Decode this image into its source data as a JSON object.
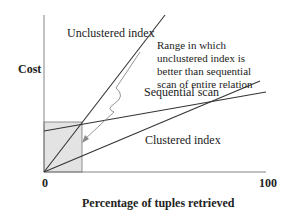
{
  "figure": {
    "y_axis_label": "Cost",
    "x_axis_label": "Percentage of tuples retrieved",
    "x_tick_min": "0",
    "x_tick_max": "100",
    "series_labels": {
      "unclustered": "Unclustered index",
      "sequential": "Sequential scan",
      "clustered": "Clustered index"
    },
    "annotation": "Range in which unclustered index is better than sequential scan of entire relation",
    "colors": {
      "line": "#333333",
      "arrow": "#888888",
      "shade": "#e3e3e3"
    }
  }
}
